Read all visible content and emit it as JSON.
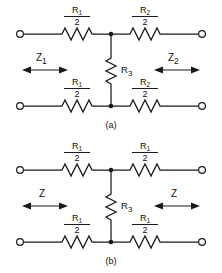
{
  "figure": {
    "type": "electrical-schematic",
    "line_color": "#1a1a1a",
    "background_color": "#ffffff"
  },
  "circuits": [
    {
      "id": "a",
      "caption": "(a)",
      "topology": "T-network",
      "arms": {
        "top_left": {
          "numerator": "R",
          "subscript": "1",
          "denominator": "2"
        },
        "top_right": {
          "numerator": "R",
          "subscript": "2",
          "denominator": "2"
        },
        "bottom_left": {
          "numerator": "R",
          "subscript": "1",
          "denominator": "2"
        },
        "bottom_right": {
          "numerator": "R",
          "subscript": "2",
          "denominator": "2"
        }
      },
      "shunt": {
        "symbol": "R",
        "subscript": "3"
      },
      "impedance_left": {
        "symbol": "Z",
        "subscript": "1"
      },
      "impedance_right": {
        "symbol": "Z",
        "subscript": "2"
      }
    },
    {
      "id": "b",
      "caption": "(b)",
      "topology": "symmetric T-network",
      "arms": {
        "top_left": {
          "numerator": "R",
          "subscript": "1",
          "denominator": "2"
        },
        "top_right": {
          "numerator": "R",
          "subscript": "1",
          "denominator": "2"
        },
        "bottom_left": {
          "numerator": "R",
          "subscript": "1",
          "denominator": "2"
        },
        "bottom_right": {
          "numerator": "R",
          "subscript": "1",
          "denominator": "2"
        }
      },
      "shunt": {
        "symbol": "R",
        "subscript": "3"
      },
      "impedance_left": {
        "symbol": "Z",
        "subscript": ""
      },
      "impedance_right": {
        "symbol": "Z",
        "subscript": ""
      }
    }
  ]
}
